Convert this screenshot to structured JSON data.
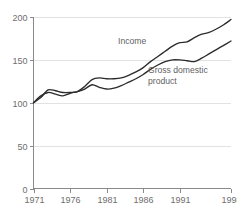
{
  "chart_data": {
    "type": "line",
    "title": "",
    "subtitle": "",
    "xlabel": "",
    "ylabel": "",
    "xlim": [
      1971,
      1998
    ],
    "ylim": [
      0,
      200
    ],
    "grid": true,
    "legend_position": "inline-annotation",
    "x_tick_labels": [
      "1971",
      "1976",
      "1981",
      "1986",
      "1991",
      "1998"
    ],
    "x_ticks": [
      1971,
      1976,
      1981,
      1986,
      1991,
      1998
    ],
    "y_tick_labels": [
      "0",
      "50",
      "100",
      "150",
      "200"
    ],
    "y_ticks": [
      0,
      50,
      100,
      150,
      200
    ],
    "x": [
      1971,
      1972,
      1973,
      1974,
      1975,
      1976,
      1977,
      1978,
      1979,
      1980,
      1981,
      1982,
      1983,
      1984,
      1985,
      1986,
      1987,
      1988,
      1989,
      1990,
      1991,
      1992,
      1993,
      1994,
      1995,
      1996,
      1997,
      1998
    ],
    "series": [
      {
        "name": "Income",
        "label": "Income",
        "color": "#2b2b2b",
        "values": [
          100,
          106,
          115,
          114,
          112,
          112,
          113,
          119,
          127,
          129,
          128,
          128,
          129,
          132,
          136,
          141,
          148,
          154,
          160,
          166,
          170,
          171,
          176,
          180,
          182,
          186,
          191,
          197
        ]
      },
      {
        "name": "Gross domestic product",
        "label": "Gross domestic\nproduct",
        "label_line1": "Gross domestic",
        "label_line2": "product",
        "color": "#2b2b2b",
        "values": [
          100,
          108,
          112,
          110,
          108,
          111,
          113,
          116,
          121,
          118,
          116,
          117,
          120,
          124,
          128,
          133,
          139,
          144,
          148,
          150,
          150,
          149,
          148,
          152,
          157,
          162,
          167,
          172
        ]
      }
    ],
    "annotations": [
      {
        "text": "Income",
        "x_px": 118,
        "y_px": 44,
        "name": "income-series-label"
      },
      {
        "text": "Gross domestic",
        "x_px": 148,
        "y_px": 73,
        "name": "gdp-series-label-line1"
      },
      {
        "text": "product",
        "x_px": 148,
        "y_px": 84,
        "name": "gdp-series-label-line2"
      }
    ],
    "colors": {
      "line": "#2b2b2b",
      "axis": "#8a8a8a",
      "grid": "#e2e2e2",
      "text": "#6e6e6e",
      "background": "#ffffff"
    }
  }
}
